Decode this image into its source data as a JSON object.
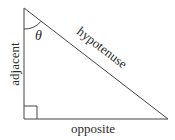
{
  "diagram": {
    "type": "right-triangle",
    "labels": {
      "angle": "θ",
      "hypotenuse": "hypotenuse",
      "adjacent": "adjacent",
      "opposite": "opposite"
    },
    "vertices": {
      "top": [
        24,
        8
      ],
      "right_angle": [
        24,
        119
      ],
      "right": [
        168,
        119
      ]
    },
    "colors": {
      "stroke": "#444444",
      "text": "#2a2a2a",
      "background": "#ffffff"
    }
  }
}
